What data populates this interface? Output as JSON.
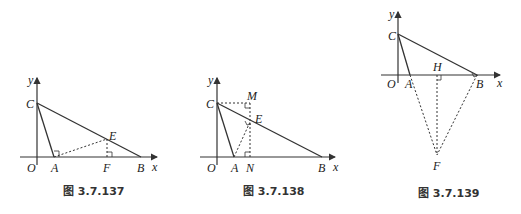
{
  "figures": [
    {
      "caption": "图 3.7.137",
      "labels": {
        "y": "y",
        "x": "x",
        "O": "O",
        "C": "C",
        "A": "A",
        "E": "E",
        "F": "F",
        "B": "B"
      }
    },
    {
      "caption": "图 3.7.138",
      "labels": {
        "y": "y",
        "x": "x",
        "O": "O",
        "C": "C",
        "M": "M",
        "E": "E",
        "A": "A",
        "N": "N",
        "B": "B"
      }
    },
    {
      "caption": "图 3.7.139",
      "labels": {
        "y": "y",
        "x": "x",
        "O": "O",
        "C": "C",
        "H": "H",
        "A": "A",
        "B": "B",
        "F": "F"
      }
    }
  ],
  "colors": {
    "line": "#333333"
  }
}
